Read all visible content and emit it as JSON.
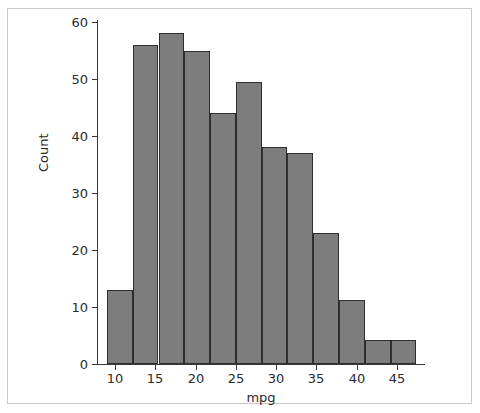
{
  "chart_data": {
    "type": "bar",
    "title": "",
    "xlabel": "mpg",
    "ylabel": "Count",
    "xlim": [
      7.5,
      48.5
    ],
    "ylim": [
      0,
      61
    ],
    "grid": false,
    "legend": null,
    "bin_edges": [
      9.0,
      12.2,
      15.4,
      18.6,
      21.8,
      25.0,
      28.2,
      31.4,
      34.6,
      37.8,
      41.0,
      44.2,
      47.4
    ],
    "bin_centers": [
      10.6,
      13.8,
      17.0,
      20.2,
      23.4,
      26.6,
      29.8,
      33.0,
      36.2,
      39.4,
      42.6,
      45.8
    ],
    "values": [
      13,
      56,
      58,
      55,
      44,
      49.5,
      38,
      37,
      23,
      11.3,
      4.2,
      4.2
    ],
    "categories": [
      "9.0-12.2",
      "12.2-15.4",
      "15.4-18.6",
      "18.6-21.8",
      "21.8-25.0",
      "25.0-28.2",
      "28.2-31.4",
      "31.4-34.6",
      "34.6-37.8",
      "37.8-41.0",
      "41.0-44.2",
      "44.2-47.4"
    ],
    "xticks": [
      10,
      15,
      20,
      25,
      30,
      35,
      40,
      45
    ],
    "yticks": [
      0,
      10,
      20,
      30,
      40,
      50,
      60
    ],
    "bar_color": "#7d7d7d",
    "bar_edge_color": "#2e2e2e",
    "background": "#ffffff"
  },
  "axes": {
    "x_label": "mpg",
    "y_label": "Count",
    "x_tick_labels": [
      "10",
      "15",
      "20",
      "25",
      "30",
      "35",
      "40",
      "45"
    ],
    "y_tick_labels": [
      "0",
      "10",
      "20",
      "30",
      "40",
      "50",
      "60"
    ]
  }
}
